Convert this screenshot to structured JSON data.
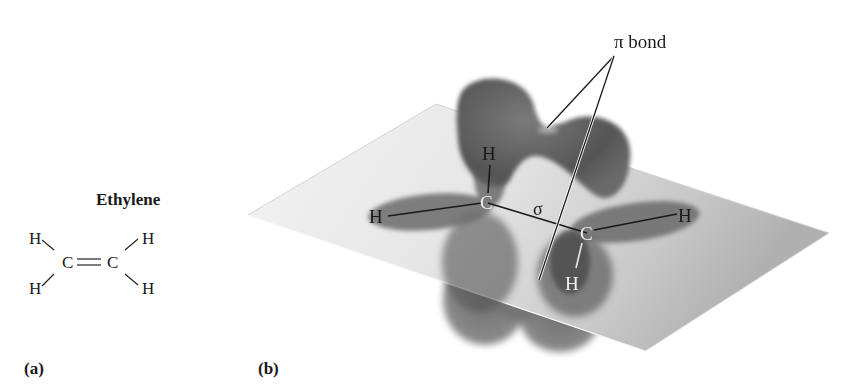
{
  "panel_a": {
    "label": "(a)",
    "title": "Ethylene",
    "formula": {
      "atoms": {
        "h_top_left": "H",
        "h_bottom_left": "H",
        "c_left": "C",
        "c_right": "C",
        "h_top_right": "H",
        "h_bottom_right": "H"
      },
      "double_bond": "="
    }
  },
  "panel_b": {
    "label": "(b)",
    "pi_bond_label": "π bond",
    "sigma_label": "σ",
    "atoms": {
      "c1": "C",
      "c2": "C",
      "h_left": "H",
      "h_top": "H",
      "h_right": "H",
      "h_bottom": "H"
    }
  },
  "colors": {
    "orbital": "#5c5c5c",
    "plane_light": "#f2f2f2",
    "plane_dark": "#b8b8b8",
    "text": "#1a1a1a"
  }
}
